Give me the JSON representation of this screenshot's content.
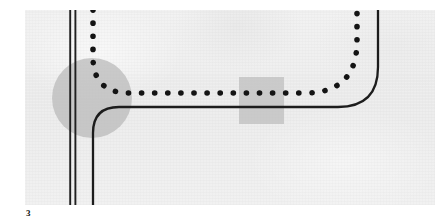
{
  "figure": {
    "caption": "3",
    "plate": {
      "background_color": "#efefef",
      "page_color": "#ffffff",
      "left": 25,
      "top": 10,
      "width": 410,
      "height": 195
    },
    "ink_color": "#1a1a1a",
    "shade_color": "#b8b8b8",
    "elements": [
      {
        "name": "double-vertical-line",
        "role": "existing-boundary-wall",
        "style": "solid double stroke",
        "x_positions": [
          45,
          50
        ],
        "y_from": 0,
        "y_to": 195,
        "stroke_width": 1.8,
        "color": "#1a1a1a"
      },
      {
        "name": "solid-route-line",
        "role": "proposed-road-alignment",
        "style": "solid",
        "stroke_width": 2.2,
        "color": "#1a1a1a",
        "path_description": "rises vertically at x=68 from bottom, fillets right at radius 26 into horizontal run at y=97, fillets up at radius 40 and rises vertically at x=353 to top"
      },
      {
        "name": "dotted-route-line",
        "role": "alternative-route-alignment",
        "style": "dotted",
        "dot_diameter": 5.6,
        "dot_spacing": 13,
        "color": "#141414",
        "path_description": "descends vertically at x=68 from top, fillets right at radius 36 into horizontal run at y=83, fillets up at radius 52 and rises vertically at x=332 to top"
      },
      {
        "name": "circle-zone-marker",
        "role": "junction-area-of-interest",
        "shape": "circle",
        "center_x": 67,
        "center_y": 88,
        "radius": 40,
        "fill": "#b9b9b9",
        "opacity": 0.72
      },
      {
        "name": "rectangle-zone-marker",
        "role": "site-area-of-interest",
        "shape": "rectangle",
        "x": 214,
        "y": 67,
        "width": 45,
        "height": 47,
        "fill": "#bdbdbd",
        "opacity": 0.72
      }
    ]
  }
}
